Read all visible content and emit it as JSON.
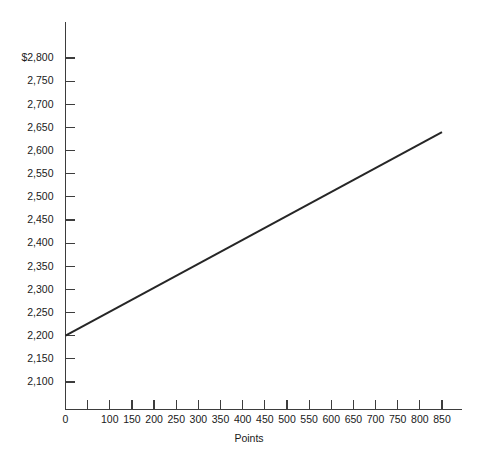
{
  "chart_data": {
    "type": "line",
    "title": "",
    "xlabel": "Points",
    "ylabel": "",
    "xlim": [
      0,
      900
    ],
    "ylim": [
      2075,
      2825
    ],
    "grid": false,
    "legend": null,
    "x_ticks": [
      0,
      50,
      100,
      150,
      200,
      250,
      300,
      350,
      400,
      450,
      500,
      550,
      600,
      650,
      700,
      750,
      800,
      850
    ],
    "x_tick_labels": [
      "0",
      "",
      "100",
      "150",
      "200",
      "250",
      "300",
      "350",
      "400",
      "450",
      "500",
      "550",
      "600",
      "650",
      "700",
      "750",
      "800",
      "850"
    ],
    "y_ticks": [
      2100,
      2150,
      2200,
      2250,
      2300,
      2350,
      2400,
      2450,
      2500,
      2550,
      2600,
      2650,
      2700,
      2750,
      2800
    ],
    "y_tick_labels": [
      "2,100",
      "2,150",
      "2,200",
      "2,250",
      "2,300",
      "2,350",
      "2,400",
      "2,450",
      "2,500",
      "2,550",
      "2,600",
      "2,650",
      "2,700",
      "2,750",
      "$2,800"
    ],
    "series": [
      {
        "name": "cost",
        "color": "#262626",
        "x": [
          0,
          850
        ],
        "y": [
          2200,
          2640
        ]
      }
    ],
    "annotations": []
  },
  "axes": {
    "x_axis_name": "Points",
    "y_axis_name": ""
  }
}
